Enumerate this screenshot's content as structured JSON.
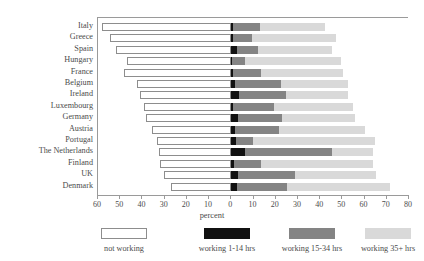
{
  "chart_data": {
    "type": "bar",
    "subtype": "diverging-stacked-horizontal",
    "title": "",
    "xlabel": "percent",
    "ylabel": "",
    "xlim": [
      -60,
      80
    ],
    "xticks": [
      -60,
      -50,
      -40,
      -30,
      -20,
      -10,
      0,
      10,
      20,
      30,
      40,
      50,
      60,
      70,
      80
    ],
    "xtick_labels": [
      "60",
      "50",
      "40",
      "30",
      "20",
      "10",
      "0",
      "10",
      "20",
      "30",
      "40",
      "50",
      "60",
      "70",
      "80"
    ],
    "grid": false,
    "legend_position": "bottom",
    "categories": [
      "Italy",
      "Greece",
      "Spain",
      "Hungary",
      "France",
      "Belgium",
      "Ireland",
      "Luxembourg",
      "Germany",
      "Austria",
      "Portugal",
      "The Netherlands",
      "Finland",
      "UK",
      "Denmark"
    ],
    "series": [
      {
        "name": "not working",
        "key": "not_working",
        "color": "#ffffff",
        "direction": "left",
        "values": [
          58.0,
          54.5,
          52.0,
          47.0,
          48.5,
          42.5,
          41.0,
          39.5,
          38.5,
          35.5,
          33.5,
          32.5,
          32.0,
          30.5,
          27.0
        ]
      },
      {
        "name": "working 1-14 hrs",
        "key": "working_1_14",
        "color": "#111111",
        "direction": "right",
        "values": [
          0.8,
          0.8,
          2.5,
          0.5,
          0.7,
          1.5,
          3.5,
          0.8,
          2.8,
          1.8,
          2.2,
          6.0,
          1.3,
          2.8,
          2.5
        ]
      },
      {
        "name": "working 15-34 hrs",
        "key": "working_15_34",
        "color": "#848484",
        "direction": "right",
        "values": [
          12.0,
          8.5,
          9.5,
          5.5,
          12.5,
          21.0,
          21.0,
          18.5,
          20.0,
          19.5,
          7.5,
          39.5,
          12.0,
          26.0,
          22.5
        ]
      },
      {
        "name": "working 35+ hrs",
        "key": "working_35_plus",
        "color": "#d9d9d9",
        "direction": "right",
        "values": [
          29.5,
          38.0,
          33.5,
          43.5,
          37.0,
          30.0,
          28.0,
          35.5,
          33.0,
          39.0,
          55.0,
          18.5,
          50.5,
          36.5,
          46.5
        ]
      }
    ],
    "legend": [
      {
        "label": "not working",
        "color": "#ffffff",
        "bordered": true
      },
      {
        "label": "working 1-14 hrs",
        "color": "#111111",
        "bordered": false
      },
      {
        "label": "working 15-34 hrs",
        "color": "#848484",
        "bordered": false
      },
      {
        "label": "working 35+ hrs",
        "color": "#d9d9d9",
        "bordered": false
      }
    ]
  },
  "colors": {
    "axis": "#9a9a9a",
    "text": "#4b4b4b",
    "background": "#ffffff",
    "not_working": "#ffffff",
    "working_1_14": "#111111",
    "working_15_34": "#848484",
    "working_35_plus": "#d9d9d9"
  }
}
